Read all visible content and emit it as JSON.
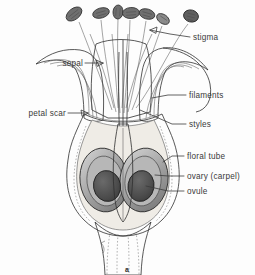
{
  "figure": {
    "caption": "a",
    "background_color": "#fdfdfd",
    "ink_color": "#2e2e2e",
    "label_color": "#3a3a3a"
  },
  "palette": {
    "outline": "#2e2e2e",
    "sepal_fill": "#8f8f8f",
    "sepal_fill_dark": "#6b6b6b",
    "floral_tube_fill": "#d8d5cf",
    "receptacle_fill": "#a9a9a9",
    "ovary_wall_fill": "#8b8b8b",
    "ovary_cavity_fill": "#b9b9b9",
    "ovule_fill": "#4e4e4e",
    "anther_fill": "#6f6f6f",
    "pedicel_fill": "#9c9c9c",
    "inner_light": "#efece6",
    "white": "#ffffff"
  },
  "labels": [
    {
      "id": "stigma",
      "text": "stigma",
      "side": "right",
      "text_x": 193,
      "text_y": 40,
      "leader": "M 190 37 L 170 34 L 150 30"
    },
    {
      "id": "sepal",
      "text": "sepal",
      "side": "left",
      "text_x": 60,
      "text_y": 66,
      "leader": "M 85 63 L 103 63"
    },
    {
      "id": "filaments",
      "text": "filaments",
      "side": "right",
      "text_x": 188,
      "text_y": 98,
      "leader": "M 186 95 L 168 95 L 152 98"
    },
    {
      "id": "petal-scar",
      "text": "petal scar",
      "side": "left",
      "text_x": 28,
      "text_y": 116,
      "leader": "M 68 113 L 88 113"
    },
    {
      "id": "styles",
      "text": "styles",
      "side": "right",
      "text_x": 188,
      "text_y": 127,
      "leader": "M 186 124 L 172 124 L 140 110"
    },
    {
      "id": "floral-tube",
      "text": "floral tube",
      "side": "right",
      "text_x": 186,
      "text_y": 159,
      "leader": "M 184 156 L 172 156 L 163 162"
    },
    {
      "id": "ovary-carpel",
      "text": "ovary (carpel)",
      "side": "right",
      "text_x": 186,
      "text_y": 179,
      "leader": "M 184 176 L 168 176 L 155 175"
    },
    {
      "id": "ovule",
      "text": "ovule",
      "side": "right",
      "text_x": 186,
      "text_y": 194,
      "leader": "M 184 191 L 168 191 L 146 186"
    }
  ],
  "structures": {
    "anthers": [
      {
        "id": "anther-1",
        "cx": 74,
        "cy": 14,
        "rot": -38
      },
      {
        "id": "anther-2",
        "cx": 101,
        "cy": 13,
        "rot": -16
      },
      {
        "id": "anther-3",
        "cx": 118,
        "cy": 12,
        "rot": 4
      },
      {
        "id": "anther-4",
        "cx": 130,
        "cy": 13,
        "rot": -2
      },
      {
        "id": "anther-5",
        "cx": 146,
        "cy": 13,
        "rot": 14
      },
      {
        "id": "anther-6",
        "cx": 162,
        "cy": 18,
        "rot": 30
      },
      {
        "id": "anther-7",
        "cx": 190,
        "cy": 16,
        "rot": 18
      }
    ],
    "ovules": [
      {
        "id": "ovule-left",
        "cx": 108,
        "cy": 185,
        "rx": 13,
        "ry": 15
      },
      {
        "id": "ovule-right",
        "cx": 142,
        "cy": 185,
        "rx": 12,
        "ry": 15
      }
    ],
    "ovary_chambers": [
      {
        "id": "chamber-left",
        "cx": 105,
        "cy": 180,
        "rx": 23,
        "ry": 31
      },
      {
        "id": "chamber-right",
        "cx": 145,
        "cy": 180,
        "rx": 22,
        "ry": 31
      }
    ]
  }
}
